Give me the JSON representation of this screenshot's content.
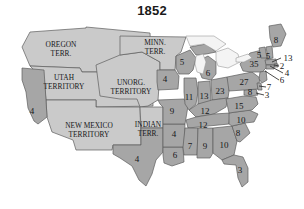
{
  "figure": {
    "title": "1852",
    "kind": "electoral-college-map",
    "background_color": "#ffffff"
  },
  "colors": {
    "state_fill": "#a6a6a6",
    "territory_fill": "#cacaca",
    "lake_fill": "#f4f4f4",
    "border_stroke": "#5d5d5d",
    "outline_stroke": "#6a6a6a",
    "text_color": "#17181a",
    "leader_line": "#2b2b2b"
  },
  "territories": [
    {
      "name": "oregon-territory",
      "line1": "OREGON",
      "line2": "TERR.",
      "x": 61,
      "y": 50
    },
    {
      "name": "utah-territory",
      "line1": "UTAH",
      "line2": "TERRITORY",
      "x": 64,
      "y": 83
    },
    {
      "name": "new-mexico-territory",
      "line1": "NEW MEXICO",
      "line2": "TERRITORY",
      "x": 89,
      "y": 131
    },
    {
      "name": "unorganized-territory",
      "line1": "UNORG.",
      "line2": "TERRITORY",
      "x": 131,
      "y": 88
    },
    {
      "name": "minnesota-territory",
      "line1": "MINN.",
      "line2": "TERR.",
      "x": 155,
      "y": 48
    },
    {
      "name": "indian-territory",
      "line1": "INDIAN",
      "line2": "TERR.",
      "x": 148,
      "y": 130
    }
  ],
  "chart_data": {
    "type": "map",
    "title": "1852",
    "value_label": "electoral votes",
    "states": [
      {
        "id": "california",
        "votes": 4,
        "x": 32,
        "y": 111
      },
      {
        "id": "texas",
        "votes": 4,
        "x": 137,
        "y": 159
      },
      {
        "id": "louisiana",
        "votes": 6,
        "x": 175,
        "y": 155
      },
      {
        "id": "arkansas",
        "votes": 4,
        "x": 174,
        "y": 134
      },
      {
        "id": "missouri",
        "votes": 9,
        "x": 172,
        "y": 111
      },
      {
        "id": "iowa",
        "votes": 4,
        "x": 165,
        "y": 79
      },
      {
        "id": "wisconsin",
        "votes": 5,
        "x": 182,
        "y": 62
      },
      {
        "id": "illinois",
        "votes": 11,
        "x": 189,
        "y": 97
      },
      {
        "id": "indiana",
        "votes": 13,
        "x": 204,
        "y": 96
      },
      {
        "id": "michigan",
        "votes": 6,
        "x": 208,
        "y": 73
      },
      {
        "id": "ohio",
        "votes": 23,
        "x": 220,
        "y": 91
      },
      {
        "id": "kentucky",
        "votes": 12,
        "x": 205,
        "y": 111
      },
      {
        "id": "tennessee",
        "votes": 12,
        "x": 203,
        "y": 125
      },
      {
        "id": "mississippi",
        "votes": 7,
        "x": 190,
        "y": 146
      },
      {
        "id": "alabama",
        "votes": 9,
        "x": 205,
        "y": 146
      },
      {
        "id": "georgia",
        "votes": 10,
        "x": 224,
        "y": 145
      },
      {
        "id": "florida",
        "votes": 3,
        "x": 240,
        "y": 170
      },
      {
        "id": "south-carolina",
        "votes": 8,
        "x": 238,
        "y": 133
      },
      {
        "id": "north-carolina",
        "votes": 10,
        "x": 241,
        "y": 120
      },
      {
        "id": "virginia",
        "votes": 15,
        "x": 239,
        "y": 106
      },
      {
        "id": "pennsylvania",
        "votes": 27,
        "x": 244,
        "y": 82
      },
      {
        "id": "new-york",
        "votes": 35,
        "x": 254,
        "y": 64
      },
      {
        "id": "vermont",
        "votes": 5,
        "x": 259,
        "y": 55
      },
      {
        "id": "new-hampshire",
        "votes": 5,
        "x": 268,
        "y": 56
      },
      {
        "id": "maine",
        "votes": 8,
        "x": 276,
        "y": 40
      },
      {
        "id": "maryland",
        "votes": 8,
        "x": 250,
        "y": 92
      }
    ],
    "callouts": [
      {
        "id": "massachusetts",
        "votes": 13,
        "label_x": 288,
        "label_y": 58,
        "tip_x": 272,
        "tip_y": 62
      },
      {
        "id": "rhode-island",
        "votes": 2,
        "label_x": 282,
        "label_y": 66,
        "tip_x": 273,
        "tip_y": 64
      },
      {
        "id": "connecticut",
        "votes": 4,
        "label_x": 287,
        "label_y": 73,
        "tip_x": 268,
        "tip_y": 66
      },
      {
        "id": "new-jersey",
        "votes": 6,
        "label_x": 282,
        "label_y": 80,
        "tip_x": 264,
        "tip_y": 71
      },
      {
        "id": "delaware",
        "votes": 7,
        "label_x": 269,
        "label_y": 87,
        "tip_x": 258,
        "tip_y": 86
      },
      {
        "id": "maryland-callout",
        "votes": 3,
        "label_x": 267,
        "label_y": 95,
        "tip_x": 256,
        "tip_y": 92
      }
    ]
  }
}
